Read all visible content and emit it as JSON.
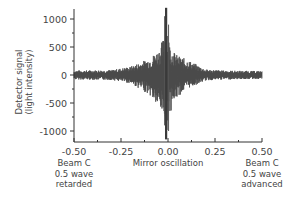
{
  "chart_data": {
    "type": "line",
    "title": "",
    "xlabel": "Mirror oscillation",
    "ylabel": "Detector signal (light intensity)",
    "xlim": [
      -0.5,
      0.5
    ],
    "ylim": [
      -1200,
      1200
    ],
    "grid": false,
    "legend": null,
    "x_ticks": [
      "-0.50",
      "-0.25",
      "0.00",
      "0.25",
      "0.50"
    ],
    "x_tick_values": [
      -0.5,
      -0.25,
      0.0,
      0.25,
      0.5
    ],
    "y_ticks": [
      "1000",
      "500",
      "0",
      "-500",
      "-1000"
    ],
    "y_tick_values": [
      1000,
      500,
      0,
      -500,
      -1000
    ],
    "annotations": [
      {
        "x": -0.5,
        "lines": [
          "Beam C",
          "0.5 wave",
          "retarded"
        ]
      },
      {
        "x": 0.5,
        "lines": [
          "Beam C",
          "0.5 wave",
          "advanced"
        ]
      }
    ],
    "series": [
      {
        "name": "Detector signal",
        "color": "#4a4a4a",
        "description": "Interferogram: rapidly oscillating signal with envelope peaking at x≈-0.01",
        "envelope": {
          "x": [
            -0.5,
            -0.3,
            -0.2,
            -0.1,
            -0.05,
            -0.02,
            -0.01,
            0.0,
            0.02,
            0.05,
            0.1,
            0.2,
            0.3,
            0.5
          ],
          "upper": [
            80,
            90,
            150,
            300,
            450,
            700,
            1200,
            700,
            450,
            350,
            280,
            100,
            80,
            70
          ],
          "lower": [
            -80,
            -90,
            -150,
            -350,
            -600,
            -750,
            -1150,
            -800,
            -600,
            -400,
            -250,
            -100,
            -80,
            -70
          ]
        }
      }
    ]
  }
}
